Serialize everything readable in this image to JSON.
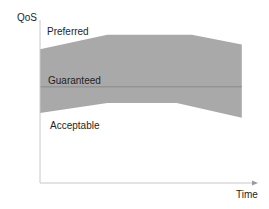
{
  "diagram": {
    "axes": {
      "y_label": "QoS",
      "x_label": "Time"
    },
    "regions": {
      "preferred_label": "Preferred",
      "guaranteed_label": "Guaranteed",
      "acceptable_label": "Acceptable"
    },
    "band": {
      "description": "Shaded QoS band between preferred (upper) and acceptable (lower) bounds, with guaranteed level line inside",
      "upper_bound": [
        {
          "t": 0.0,
          "q": 0.82
        },
        {
          "t": 0.31,
          "q": 0.91
        },
        {
          "t": 0.7,
          "q": 0.91
        },
        {
          "t": 0.93,
          "q": 0.85
        }
      ],
      "lower_bound": [
        {
          "t": 0.0,
          "q": 0.43
        },
        {
          "t": 0.31,
          "q": 0.49
        },
        {
          "t": 0.63,
          "q": 0.49
        },
        {
          "t": 0.93,
          "q": 0.4
        }
      ],
      "guaranteed_level": 0.59
    },
    "colors": {
      "band_fill": "#a9a9a9",
      "guaranteed_line": "#8a8a8a",
      "axis": "#c8c8c8",
      "text": "#1e1e1e"
    }
  }
}
